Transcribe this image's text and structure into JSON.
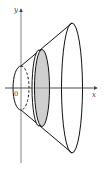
{
  "diagram": {
    "type": "solid-of-revolution",
    "axes": {
      "x_label": "x",
      "y_label": "y",
      "origin_label": "0"
    },
    "colors": {
      "stroke": "#111111",
      "axis": "#555555",
      "disk_fill": "#cfcfcf",
      "background": "#ffffff"
    },
    "shapes": {
      "small_end": {
        "cx": 21,
        "cy": 88,
        "rx": 8,
        "ry": 22,
        "back_half": "dashed"
      },
      "disk_slice": {
        "cx": 42,
        "cy": 88,
        "rx": 8,
        "ry": 39,
        "shaded": true
      },
      "large_end": {
        "cx": 72,
        "cy": 88,
        "rx": 11,
        "ry": 65
      }
    }
  }
}
